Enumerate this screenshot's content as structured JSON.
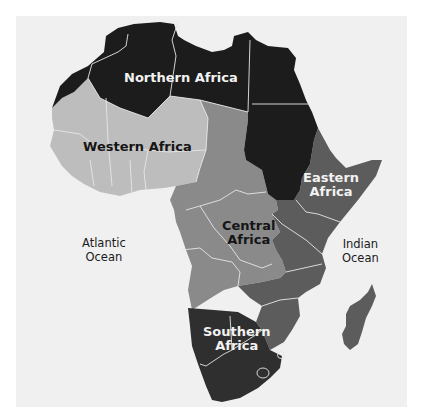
{
  "map": {
    "title": "Regions of Africa",
    "colors": {
      "background": "#f0f0f0",
      "northern": "#1c1c1c",
      "western": "#bdbdbd",
      "central": "#8a8a8a",
      "eastern": "#5c5c5c",
      "southern": "#2f2f2f",
      "borders": "#e6e6e6"
    },
    "regions": [
      {
        "id": "northern",
        "label": "Northern Africa"
      },
      {
        "id": "western",
        "label": "Western Africa"
      },
      {
        "id": "central",
        "label_line1": "Central",
        "label_line2": "Africa"
      },
      {
        "id": "eastern",
        "label_line1": "Eastern",
        "label_line2": "Africa"
      },
      {
        "id": "southern",
        "label_line1": "Southern",
        "label_line2": "Africa"
      }
    ],
    "oceans": [
      {
        "id": "atlantic",
        "line1": "Atlantic",
        "line2": "Ocean"
      },
      {
        "id": "indian",
        "line1": "Indian",
        "line2": "Ocean"
      }
    ]
  }
}
